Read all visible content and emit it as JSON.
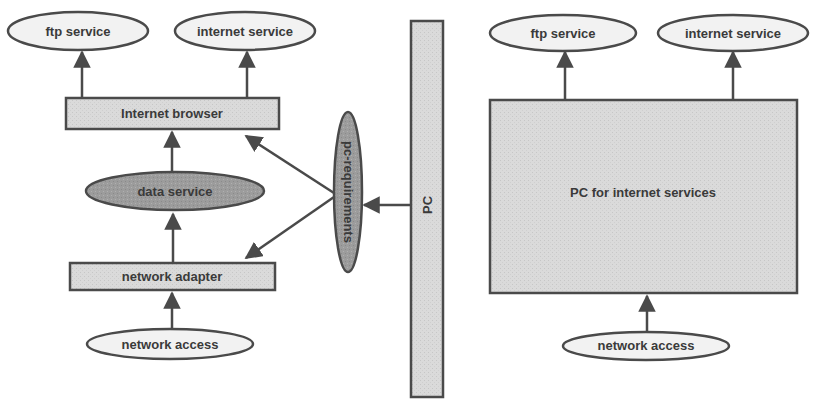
{
  "colors": {
    "stroke": "#4a4a4a",
    "ellipse_light_fill": "#f0f0f0",
    "box_fill": "#dcdcdc",
    "dark_fill": "#9a9a9a",
    "pc_bar_fill": "#d9d9d9",
    "big_box_fill": "#d6d6d6",
    "text": "#3a3a3a"
  },
  "left_diagram": {
    "ftp_service": "ftp service",
    "internet_service": "internet service",
    "internet_browser": "Internet browser",
    "data_service": "data service",
    "network_adapter": "network adapter",
    "network_access": "network access",
    "pc_requirements": "pc-requirements"
  },
  "pc_bar": {
    "label": "PC"
  },
  "right_diagram": {
    "ftp_service": "ftp service",
    "internet_service": "internet service",
    "pc_box": "PC for internet services",
    "network_access": "network access"
  }
}
